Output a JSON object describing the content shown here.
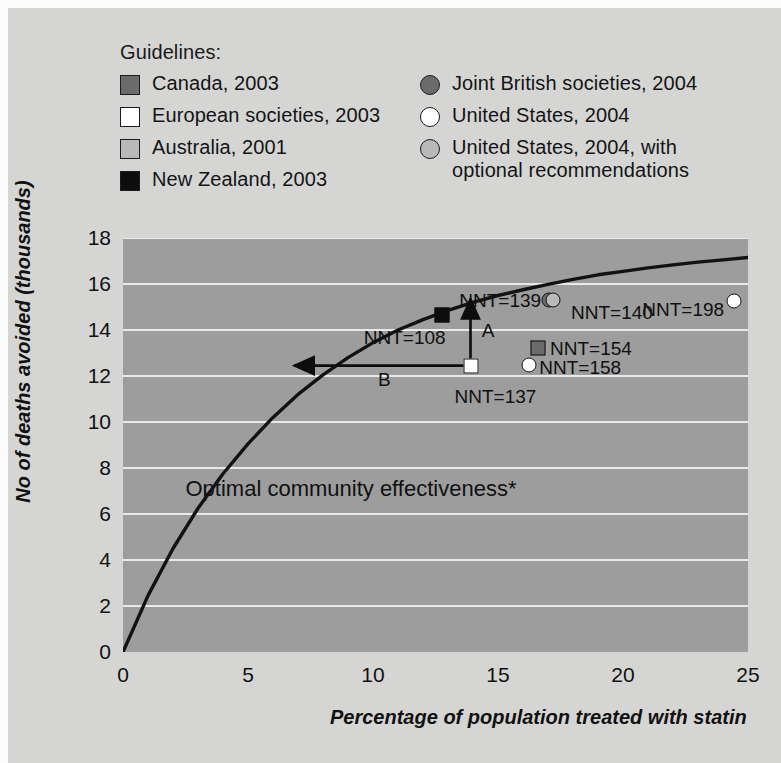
{
  "legend": {
    "title": "Guidelines:",
    "left_items": [
      {
        "label": "Canada, 2003",
        "marker": "square",
        "fill": "#6b6b6b",
        "name": "legend-canada"
      },
      {
        "label": "European societies, 2003",
        "marker": "square",
        "fill": "#ffffff",
        "name": "legend-european-societies"
      },
      {
        "label": "Australia, 2001",
        "marker": "square",
        "fill": "#b9b9b9",
        "name": "legend-australia"
      },
      {
        "label": "New Zealand, 2003",
        "marker": "square",
        "fill": "#0d0d0d",
        "name": "legend-new-zealand"
      }
    ],
    "right_items": [
      {
        "label": "Joint British societies, 2004",
        "marker": "circle",
        "fill": "#6b6b6b",
        "name": "legend-joint-british-societies"
      },
      {
        "label": "United States, 2004",
        "marker": "circle",
        "fill": "#ffffff",
        "name": "legend-united-states"
      },
      {
        "label": "United States, 2004, with\noptional recommendations",
        "marker": "circle",
        "fill": "#b9b9b9",
        "name": "legend-united-states-optional"
      }
    ]
  },
  "chart_data": {
    "type": "scatter",
    "title": "",
    "xlabel": "Percentage of population treated with statin",
    "ylabel": "No of deaths avoided (thousands)",
    "xlim": [
      0,
      25
    ],
    "ylim": [
      0,
      18
    ],
    "xticks": [
      "0",
      "5",
      "10",
      "15",
      "20",
      "25"
    ],
    "yticks": [
      "0",
      "2",
      "4",
      "6",
      "8",
      "10",
      "12",
      "14",
      "16",
      "18"
    ],
    "grid": "horizontal",
    "plot_bg": "#9d9d9d",
    "gridline_color": "#e9e9e9",
    "curve_label": "Optimal community effectiveness*",
    "curve": {
      "description": "Optimal community effectiveness curve, concave increasing",
      "x": [
        0,
        1,
        2,
        3,
        4,
        5,
        6,
        7,
        8,
        9,
        10,
        11,
        12,
        13,
        14,
        15,
        16,
        17,
        18,
        19,
        20,
        21,
        22,
        23,
        24,
        25
      ],
      "y": [
        0,
        2.45,
        4.5,
        6.25,
        7.75,
        9.05,
        10.2,
        11.2,
        12.05,
        12.8,
        13.45,
        14.0,
        14.45,
        14.85,
        15.2,
        15.5,
        15.75,
        15.98,
        16.2,
        16.4,
        16.55,
        16.7,
        16.83,
        16.95,
        17.05,
        17.15
      ]
    },
    "points": [
      {
        "name": "new-zealand-2003",
        "label": "NNT=108",
        "x": 12.75,
        "y": 14.65,
        "marker": "square",
        "fill": "#0d0d0d",
        "label_dx": -78,
        "label_dy": 22
      },
      {
        "name": "joint-british-societies-2004",
        "label": "NNT=139",
        "x": 17.05,
        "y": 15.3,
        "marker": "circle",
        "fill": "#6b6b6b",
        "label_dx": -90,
        "label_dy": 0
      },
      {
        "name": "united-states-2004-optional",
        "label": "NNT=140",
        "x": 17.2,
        "y": 15.3,
        "marker": "circle",
        "fill": "#b9b9b9",
        "label_dx": 18,
        "label_dy": 12
      },
      {
        "name": "united-states-2004",
        "label": "NNT=198",
        "x": 24.45,
        "y": 15.25,
        "marker": "circle",
        "fill": "#ffffff",
        "label_dx": -92,
        "label_dy": 8
      },
      {
        "name": "canada-2003",
        "label": "NNT=154",
        "x": 16.6,
        "y": 13.2,
        "marker": "square",
        "fill": "#6b6b6b",
        "label_dx": 12,
        "label_dy": 0
      },
      {
        "name": "united-states-2004-open",
        "label": "NNT=158",
        "x": 16.25,
        "y": 12.5,
        "marker": "circle",
        "fill": "#ffffff",
        "label_dx": 10,
        "label_dy": 2
      },
      {
        "name": "european-societies-2003",
        "label": "NNT=137",
        "x": 13.9,
        "y": 12.45,
        "marker": "square",
        "fill": "#ffffff",
        "label_dx": -16,
        "label_dy": 30
      }
    ],
    "annotations": [
      {
        "name": "arrow-a",
        "label": "A",
        "from": [
          13.9,
          12.45
        ],
        "to": [
          13.9,
          15.35
        ],
        "label_x": 14.35,
        "label_y": 13.7
      },
      {
        "name": "arrow-b",
        "label": "B",
        "from": [
          13.9,
          12.45
        ],
        "to": [
          6.85,
          12.45
        ],
        "label_x": 10.2,
        "label_y": 11.55
      }
    ]
  }
}
